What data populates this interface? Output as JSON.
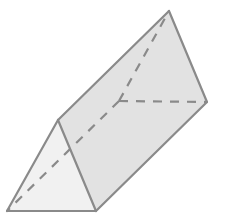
{
  "diagram": {
    "colors": {
      "background": "#ffffff",
      "edge": "#8a8a8a",
      "front_face": "#f1f1f1",
      "side_face": "#e2e2e2",
      "top_face": "#e8e8e8"
    },
    "vertices": {
      "front_apex": [
        58,
        120
      ],
      "front_bottom_left": [
        7,
        211
      ],
      "front_bottom_right": [
        96,
        211
      ],
      "back_apex": [
        169,
        11
      ],
      "back_bottom_right": [
        207,
        102
      ],
      "back_bottom_left_hidden": [
        119,
        101
      ]
    },
    "visible_edges": [
      [
        "front_apex",
        "front_bottom_left"
      ],
      [
        "front_bottom_left",
        "front_bottom_right"
      ],
      [
        "front_bottom_right",
        "front_apex"
      ],
      [
        "front_apex",
        "back_apex"
      ],
      [
        "front_bottom_right",
        "back_bottom_right"
      ],
      [
        "back_apex",
        "back_bottom_right"
      ]
    ],
    "hidden_edges": [
      [
        "back_bottom_left_hidden",
        "back_apex"
      ],
      [
        "back_bottom_left_hidden",
        "back_bottom_right"
      ],
      [
        "back_bottom_left_hidden",
        "front_bottom_left"
      ]
    ]
  }
}
